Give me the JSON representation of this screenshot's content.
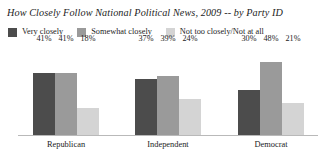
{
  "chart_data": {
    "type": "bar",
    "title": "How Closely Follow National Political News, 2009 -- by Party ID",
    "xlabel": "",
    "ylabel": "",
    "ylim": [
      0,
      60
    ],
    "grid": false,
    "legend_position": "top-left",
    "categories": [
      "Republican",
      "Independent",
      "Democrat"
    ],
    "series": [
      {
        "name": "Very closely",
        "color": "#4c4c4c",
        "values": [
          41,
          37,
          30
        ],
        "labels": [
          "41%",
          "37%",
          "30%"
        ]
      },
      {
        "name": "Somewhat closely",
        "color": "#9a9a9a",
        "values": [
          41,
          39,
          48
        ],
        "labels": [
          "41%",
          "39%",
          "48%"
        ]
      },
      {
        "name": "Not too closely/Not at all",
        "color": "#d4d4d4",
        "values": [
          18,
          24,
          21
        ],
        "labels": [
          "18%",
          "24%",
          "21%"
        ]
      }
    ]
  },
  "legend": {
    "items": [
      {
        "label": "Very closely",
        "color": "#4c4c4c"
      },
      {
        "label": "Somewhat closely",
        "color": "#9a9a9a"
      },
      {
        "label": "Not too closely/Not at all",
        "color": "#d4d4d4"
      }
    ]
  },
  "axis": {
    "line_color": "#b9b9b9"
  }
}
